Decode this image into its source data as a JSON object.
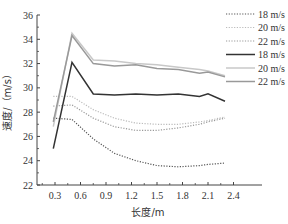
{
  "chart_data": {
    "type": "line",
    "title": "",
    "xlabel": "长度/m",
    "ylabel": "速度/（m/s）",
    "xlim": [
      0.1,
      2.5
    ],
    "ylim": [
      22,
      36
    ],
    "xticks": [
      0.3,
      0.6,
      0.9,
      1.2,
      1.5,
      1.8,
      2.1,
      2.4
    ],
    "yticks": [
      22,
      24,
      26,
      28,
      30,
      32,
      34,
      36
    ],
    "grid": false,
    "legend_position": "upper right",
    "x": [
      0.28,
      0.5,
      0.75,
      1.0,
      1.25,
      1.5,
      1.75,
      2.0,
      2.1,
      2.3
    ],
    "series": [
      {
        "name": "18 m/s",
        "style": "dotted",
        "color": "#555555",
        "values": [
          27.5,
          27.4,
          25.8,
          24.6,
          24.0,
          23.6,
          23.5,
          23.6,
          23.7,
          23.8
        ]
      },
      {
        "name": "20 m/s",
        "style": "dotted",
        "color": "#bbbbbb",
        "values": [
          29.3,
          29.3,
          28.2,
          27.5,
          27.1,
          27.0,
          27.0,
          27.2,
          27.3,
          27.6
        ]
      },
      {
        "name": "22 m/s",
        "style": "dotted",
        "color": "#999999",
        "values": [
          28.5,
          28.6,
          27.5,
          26.8,
          26.5,
          26.5,
          26.7,
          27.0,
          27.2,
          27.5
        ]
      },
      {
        "name": "18 m/s",
        "style": "solid",
        "color": "#333333",
        "values": [
          25.0,
          32.1,
          29.5,
          29.4,
          29.5,
          29.4,
          29.5,
          29.3,
          29.5,
          28.9
        ]
      },
      {
        "name": "20 m/s",
        "style": "solid",
        "color": "#c8c8c8",
        "values": [
          26.8,
          34.5,
          32.3,
          32.2,
          32.0,
          31.9,
          31.7,
          31.5,
          31.4,
          31.0
        ]
      },
      {
        "name": "22 m/s",
        "style": "solid",
        "color": "#999999",
        "values": [
          27.2,
          34.3,
          32.0,
          31.8,
          31.9,
          31.6,
          31.5,
          31.2,
          31.3,
          30.9
        ]
      }
    ]
  },
  "legend": {
    "items": [
      {
        "label": "18 m/s",
        "style": "dotted",
        "color": "#555555"
      },
      {
        "label": "20 m/s",
        "style": "dotted",
        "color": "#bbbbbb"
      },
      {
        "label": "22 m/s",
        "style": "dotted",
        "color": "#999999"
      },
      {
        "label": "18 m/s",
        "style": "solid",
        "color": "#333333"
      },
      {
        "label": "20 m/s",
        "style": "solid",
        "color": "#c8c8c8"
      },
      {
        "label": "22 m/s",
        "style": "solid",
        "color": "#999999"
      }
    ]
  },
  "axes": {
    "x_title": "长度/m",
    "y_title": "速度/（m/s）"
  }
}
